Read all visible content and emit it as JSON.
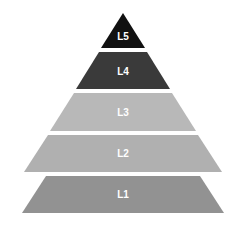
{
  "diagram": {
    "type": "pyramid",
    "title": "",
    "background_color": "#ffffff",
    "label_color": "#ffffff",
    "apex": {
      "x": 123,
      "y": 13
    },
    "base": {
      "left_x": 22,
      "right_x": 224,
      "y": 213
    },
    "levels": [
      {
        "id": "L5",
        "label": "L5",
        "rank": 5,
        "position_from_top": 1,
        "color": "#111111",
        "shape": "triangle",
        "label_x": 123,
        "label_y": 37,
        "label_font_size": 10,
        "points": "123,13 145,48 101,48"
      },
      {
        "id": "L4",
        "label": "L4",
        "rank": 4,
        "position_from_top": 2,
        "color": "#3a3a3a",
        "shape": "trapezoid",
        "label_x": 123,
        "label_y": 72,
        "label_font_size": 10,
        "points": "147,52 170,89 76,89 99,52"
      },
      {
        "id": "L3",
        "label": "L3",
        "rank": 3,
        "position_from_top": 3,
        "color": "#b8b8b8",
        "shape": "trapezoid",
        "label_x": 123,
        "label_y": 113,
        "label_font_size": 10,
        "points": "172,93 196,131 50,131 74,93"
      },
      {
        "id": "L2",
        "label": "L2",
        "rank": 2,
        "position_from_top": 4,
        "color": "#b0b0b0",
        "shape": "trapezoid",
        "label_x": 123,
        "label_y": 154,
        "label_font_size": 10,
        "points": "198,135 222,172 24,172 48,135"
      },
      {
        "id": "L1",
        "label": "L1",
        "rank": 1,
        "position_from_top": 5,
        "color": "#929292",
        "shape": "trapezoid",
        "label_x": 123,
        "label_y": 195,
        "label_font_size": 10,
        "points": "200,176 224,213 22,213 46,176"
      }
    ]
  }
}
